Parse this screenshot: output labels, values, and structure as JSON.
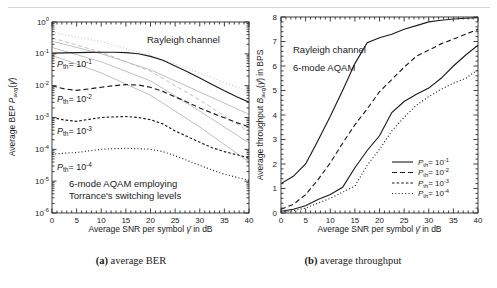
{
  "palette": {
    "dark": "#1c1c1c",
    "gray": "#c0c0c0",
    "axis": "#2b2b2b",
    "text": "#1a1a1a",
    "rule": "#d6d6d6"
  },
  "captions": {
    "a": {
      "label": "(a)",
      "text": " average BER"
    },
    "b": {
      "label": "(b)",
      "text": " average throughput"
    }
  },
  "chart_data": [
    {
      "id": "ber",
      "dom": "ber-chart",
      "type": "line",
      "title": "(a) average BER",
      "xlabel": "Average SNR per symbol γ̄ in dB",
      "ylabel": "Average BEP Pavg(γ̄)",
      "grid": false,
      "x": {
        "min": 0,
        "max": 40,
        "ticks": [
          0,
          5,
          10,
          15,
          20,
          25,
          30,
          35,
          40
        ],
        "minor_step": 1
      },
      "y": {
        "log": true,
        "min": -6,
        "max": 0,
        "tick_exponents": [
          0,
          -1,
          -2,
          -3,
          -4,
          -5,
          -6
        ]
      },
      "plot": {
        "l": 52,
        "t": 22,
        "r": 249,
        "b": 213
      },
      "tick_fs": 8,
      "annotations": [
        {
          "id": "rayleigh-channel-label",
          "t": "Rayleigh channel",
          "x": 147,
          "y": 43,
          "fs": 9.5
        },
        {
          "id": "pth-1e-1-label",
          "t": "/P/_{th}= 10^{-1}",
          "x": 57,
          "y": 67,
          "fs": 9
        },
        {
          "id": "pth-1e-2-label",
          "t": "/P/_{th}= 10^{-2}",
          "x": 57,
          "y": 102,
          "fs": 9
        },
        {
          "id": "pth-1e-3-label",
          "t": "/P/_{th}= 10^{-3}",
          "x": 57,
          "y": 134,
          "fs": 9
        },
        {
          "id": "pth-1e-4-label",
          "t": "/P/_{th}= 10^{-4}",
          "x": 57,
          "y": 170,
          "fs": 9
        },
        {
          "id": "scheme-label-line1",
          "t": "6-mode AQAM employing",
          "x": 69,
          "y": 187,
          "fs": 9.5
        },
        {
          "id": "scheme-label-line2",
          "t": "Torrance's switching levels",
          "x": 69,
          "y": 198.5,
          "fs": 9.5
        },
        {
          "id": "x-axis-label",
          "t": "Average SNR per symbol /γ̄/  in dB",
          "x": 150.5,
          "y": 232,
          "fs": 8.5,
          "anchor": "middle"
        },
        {
          "id": "y-axis-label",
          "t": "Average BEP /P/_{avg}(/γ̄/)",
          "x": 15,
          "y": 117,
          "fs": 8.5,
          "anchor": "middle",
          "rot": -90
        }
      ],
      "series": [
        {
          "id": "reference-1",
          "name": "fixed-mode reference 1",
          "color": "gray",
          "dash": "1,2.3",
          "w": 1,
          "x": [
            0,
            10,
            20,
            30,
            40
          ],
          "y": [
            -0.32,
            -0.62,
            -1.05,
            -1.6,
            -2.2
          ]
        },
        {
          "id": "reference-2",
          "name": "fixed-mode reference 2",
          "color": "gray",
          "dash": "4,2.8",
          "w": 1,
          "x": [
            0,
            10,
            20,
            30,
            40
          ],
          "y": [
            -0.5,
            -0.95,
            -1.55,
            -2.45,
            -3.45
          ]
        },
        {
          "id": "reference-3",
          "name": "fixed-mode reference 3",
          "color": "gray",
          "dash": "",
          "w": 1,
          "x": [
            0,
            10,
            20,
            30,
            40
          ],
          "y": [
            -0.6,
            -1.0,
            -1.5,
            -2.2,
            -2.9
          ]
        },
        {
          "id": "reference-4",
          "name": "fixed-mode reference 4",
          "color": "gray",
          "dash": "",
          "w": 1,
          "x": [
            0,
            10,
            20,
            30,
            40
          ],
          "y": [
            -0.8,
            -1.25,
            -1.85,
            -2.8,
            -3.8
          ]
        },
        {
          "id": "reference-5",
          "name": "fixed-mode reference 5",
          "color": "gray",
          "dash": "",
          "w": 1,
          "x": [
            0,
            10,
            20,
            30,
            40
          ],
          "y": [
            -1.05,
            -1.6,
            -2.3,
            -3.3,
            -4.4
          ]
        },
        {
          "id": "pth-1e-1",
          "name": "Pth = 10^-1",
          "color": "dark",
          "dash": "",
          "w": 1.15,
          "x": [
            0,
            2.5,
            5,
            7.5,
            10,
            12.5,
            15,
            17.5,
            20,
            22.5,
            25,
            27.5,
            30,
            32.5,
            35,
            37.5,
            40
          ],
          "y": [
            -0.98,
            -0.97,
            -0.96,
            -0.955,
            -0.95,
            -0.95,
            -0.96,
            -1.0,
            -1.08,
            -1.2,
            -1.38,
            -1.56,
            -1.76,
            -1.96,
            -2.16,
            -2.35,
            -2.52
          ]
        },
        {
          "id": "pth-1e-2",
          "name": "Pth = 10^-2",
          "color": "dark",
          "dash": "5,3",
          "w": 1.15,
          "x": [
            0,
            2.5,
            5,
            7.5,
            10,
            12.5,
            15,
            17.5,
            20,
            22.5,
            25,
            27.5,
            30,
            32.5,
            35,
            37.5,
            40
          ],
          "y": [
            -2.0,
            -2.1,
            -2.15,
            -2.1,
            -2.05,
            -2.0,
            -1.97,
            -1.98,
            -2.05,
            -2.18,
            -2.35,
            -2.52,
            -2.7,
            -2.86,
            -3.01,
            -3.16,
            -3.3
          ]
        },
        {
          "id": "pth-1e-3",
          "name": "Pth = 10^-3",
          "color": "dark",
          "dash": "2.6,2",
          "w": 1.15,
          "x": [
            0,
            2.5,
            5,
            7.5,
            10,
            12.5,
            15,
            17.5,
            20,
            22.5,
            25,
            27.5,
            30,
            32.5,
            35,
            37.5,
            40
          ],
          "y": [
            -3.0,
            -3.08,
            -3.12,
            -3.06,
            -3.0,
            -2.98,
            -2.97,
            -3.0,
            -3.07,
            -3.2,
            -3.42,
            -3.6,
            -3.78,
            -3.95,
            -4.07,
            -4.17,
            -4.27
          ]
        },
        {
          "id": "pth-1e-4",
          "name": "Pth = 10^-4",
          "color": "dark",
          "dash": "1,2.3",
          "w": 1.15,
          "x": [
            0,
            2.5,
            5,
            7.5,
            10,
            12.5,
            15,
            17.5,
            20,
            22.5,
            25,
            27.5,
            30,
            32.5,
            35,
            37.5,
            40
          ],
          "y": [
            -4.15,
            -4.12,
            -4.1,
            -4.05,
            -4.0,
            -3.98,
            -3.97,
            -3.98,
            -4.0,
            -4.07,
            -4.2,
            -4.35,
            -4.5,
            -4.65,
            -4.78,
            -4.88,
            -4.97
          ]
        }
      ]
    },
    {
      "id": "throughput",
      "dom": "throughput-chart",
      "type": "line",
      "title": "(b) average throughput",
      "xlabel": "Average SNR per symbol γ̄ in dB",
      "ylabel": "Average throughput Bavg(γ̄) in BPS",
      "grid": false,
      "x": {
        "min": 0,
        "max": 40,
        "ticks": [
          0,
          5,
          10,
          15,
          20,
          25,
          30,
          35,
          40
        ],
        "minor_step": 1
      },
      "y": {
        "log": false,
        "min": 0,
        "max": 8,
        "ticks": [
          0,
          1,
          2,
          3,
          4,
          5,
          6,
          7,
          8
        ],
        "minor_step": 0.2
      },
      "plot": {
        "l": 31,
        "t": 17,
        "r": 228,
        "b": 213
      },
      "tick_fs": 8,
      "annotations": [
        {
          "id": "rayleigh-channel-label",
          "t": "Rayleigh channel",
          "x": 43,
          "y": 53,
          "fs": 9.5
        },
        {
          "id": "scheme-label",
          "t": "6-mode AQAM",
          "x": 43,
          "y": 71,
          "fs": 9.5
        },
        {
          "id": "x-axis-label",
          "t": "Average SNR per symbol /γ̄/  in dB",
          "x": 129.5,
          "y": 232,
          "fs": 8.5,
          "anchor": "middle"
        },
        {
          "id": "y-axis-label",
          "t": "Average throughput /B/_{avg}(/γ̄/) in BPS",
          "x": 13,
          "y": 115,
          "fs": 8.5,
          "anchor": "middle",
          "rot": -90
        }
      ],
      "legend": {
        "position": "lower right",
        "lx1": 142,
        "lx2": 163,
        "tx": 168,
        "fs": 8,
        "ys": [
          162,
          172.5,
          183,
          193.5
        ],
        "items": [
          {
            "dash": "",
            "t": "/P/_{th}= 10^{-1}"
          },
          {
            "dash": "5,3",
            "t": "/P/_{th}= 10^{-2}"
          },
          {
            "dash": "2.6,2",
            "t": "/P/_{th}= 10^{-3}"
          },
          {
            "dash": "1,2.3",
            "t": "/P/_{th}= 10^{-4}"
          }
        ]
      },
      "series": [
        {
          "id": "pth-1e-1",
          "name": "Pth = 10^-1",
          "color": "dark",
          "dash": "",
          "w": 1.15,
          "x": [
            0,
            2.5,
            5,
            7.5,
            10,
            12.5,
            15,
            17.5,
            20,
            22.5,
            25,
            27.5,
            30,
            32.5,
            35,
            37.5,
            40
          ],
          "y": [
            1.2,
            1.5,
            2.0,
            2.95,
            3.95,
            5.0,
            6.1,
            6.95,
            7.15,
            7.3,
            7.5,
            7.65,
            7.8,
            7.87,
            7.92,
            7.95,
            7.97
          ]
        },
        {
          "id": "pth-1e-2",
          "name": "Pth = 10^-2",
          "color": "dark",
          "dash": "5,3",
          "w": 1.15,
          "x": [
            0,
            2.5,
            5,
            7.5,
            10,
            12.5,
            15,
            17.5,
            20,
            22.5,
            25,
            27.5,
            30,
            32.5,
            35,
            37.5,
            40
          ],
          "y": [
            0.15,
            0.35,
            0.75,
            1.35,
            2.05,
            2.85,
            3.6,
            4.25,
            4.95,
            5.45,
            5.95,
            6.4,
            6.65,
            6.9,
            7.1,
            7.3,
            7.5
          ]
        },
        {
          "id": "pth-1e-3",
          "name": "Pth = 10^-3",
          "color": "dark",
          "dash": "",
          "w": 1.15,
          "x": [
            0,
            2.5,
            5,
            7.5,
            10,
            12.5,
            15,
            17.5,
            20,
            22.5,
            25,
            27.5,
            30,
            32.5,
            35,
            37.5,
            40
          ],
          "y": [
            0.07,
            0.15,
            0.3,
            0.55,
            0.75,
            1.05,
            1.85,
            2.55,
            3.15,
            4.1,
            4.55,
            4.85,
            5.1,
            5.5,
            6.0,
            6.45,
            6.85
          ]
        },
        {
          "id": "pth-1e-4",
          "name": "Pth = 10^-4",
          "color": "dark",
          "dash": "1,2.3",
          "w": 1.15,
          "x": [
            0,
            2.5,
            5,
            7.5,
            10,
            12.5,
            15,
            17.5,
            20,
            22.5,
            25,
            27.5,
            30,
            32.5,
            35,
            37.5,
            40
          ],
          "y": [
            0.05,
            0.1,
            0.2,
            0.4,
            0.6,
            0.85,
            1.1,
            1.95,
            2.6,
            3.35,
            3.9,
            4.4,
            4.75,
            5.05,
            5.3,
            5.5,
            5.85
          ]
        }
      ]
    }
  ]
}
